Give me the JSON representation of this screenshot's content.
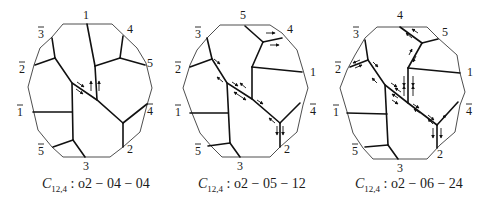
{
  "figure": {
    "panels": [
      {
        "caption": {
          "prefix": "C",
          "subscript": "12,4",
          "rest": " : o2 − 04 − 04",
          "x": 42
        },
        "outline": [
          [
            63,
            24
          ],
          [
            112,
            24
          ],
          [
            137,
            48
          ],
          [
            146,
            63
          ],
          [
            152,
            88
          ],
          [
            147,
            105
          ],
          [
            140,
            132
          ],
          [
            123,
            147
          ],
          [
            110,
            157
          ],
          [
            63,
            157
          ],
          [
            52,
            147
          ],
          [
            38,
            130
          ],
          [
            28,
            87
          ],
          [
            34,
            65
          ],
          [
            40,
            48
          ],
          [
            52,
            37
          ]
        ],
        "edges": [
          [
            [
              52,
              38
            ],
            [
              55,
              58
            ]
          ],
          [
            [
              35,
              65
            ],
            [
              55,
              58
            ]
          ],
          [
            [
              55,
              58
            ],
            [
              72,
              83
            ],
            [
              97,
              100
            ],
            [
              123,
              123
            ]
          ],
          [
            [
              72,
              83
            ],
            [
              73,
              140
            ]
          ],
          [
            [
              33,
              112
            ],
            [
              72,
              112
            ]
          ],
          [
            [
              53,
              147
            ],
            [
              73,
              140
            ]
          ],
          [
            [
              73,
              140
            ],
            [
              85,
              157
            ]
          ],
          [
            [
              87,
              24
            ],
            [
              95,
              66
            ]
          ],
          [
            [
              95,
              66
            ],
            [
              97,
              100
            ]
          ],
          [
            [
              95,
              66
            ],
            [
              120,
              58
            ]
          ],
          [
            [
              120,
              58
            ],
            [
              123,
              36
            ]
          ],
          [
            [
              120,
              58
            ],
            [
              145,
              65
            ]
          ],
          [
            [
              123,
              123
            ],
            [
              147,
              104
            ]
          ],
          [
            [
              123,
              123
            ],
            [
              123,
              147
            ]
          ]
        ],
        "arrows": [
          {
            "x1": 77,
            "y1": 82,
            "x2": 84,
            "y2": 87
          },
          {
            "x1": 76,
            "y1": 89,
            "x2": 83,
            "y2": 94
          },
          {
            "x1": 91,
            "y1": 91,
            "x2": 91,
            "y2": 81
          },
          {
            "x1": 99,
            "y1": 91,
            "x2": 99,
            "y2": 81
          }
        ],
        "labels": [
          {
            "text": "1",
            "bar": false,
            "x": 86,
            "y": 19
          },
          {
            "text": "4",
            "bar": false,
            "x": 130,
            "y": 33
          },
          {
            "text": "5",
            "bar": false,
            "x": 150,
            "y": 67
          },
          {
            "text": "3",
            "bar": true,
            "x": 41,
            "y": 38
          },
          {
            "text": "2",
            "bar": true,
            "x": 22,
            "y": 73
          },
          {
            "text": "1",
            "bar": true,
            "x": 20,
            "y": 116
          },
          {
            "text": "4",
            "bar": true,
            "x": 150,
            "y": 115
          },
          {
            "text": "5",
            "bar": true,
            "x": 41,
            "y": 155
          },
          {
            "text": "2",
            "bar": false,
            "x": 130,
            "y": 153
          },
          {
            "text": "3",
            "bar": false,
            "x": 86,
            "y": 170
          }
        ]
      },
      {
        "caption": {
          "prefix": "C",
          "subscript": "12,4",
          "rest": " : o2 − 05 − 12",
          "x": 198
        },
        "outline": [
          [
            220,
            25
          ],
          [
            270,
            25
          ],
          [
            282,
            33
          ],
          [
            297,
            50
          ],
          [
            303,
            70
          ],
          [
            308,
            88
          ],
          [
            303,
            105
          ],
          [
            297,
            132
          ],
          [
            280,
            147
          ],
          [
            270,
            157
          ],
          [
            222,
            157
          ],
          [
            212,
            147
          ],
          [
            200,
            133
          ],
          [
            192,
            113
          ],
          [
            183,
            88
          ],
          [
            190,
            65
          ],
          [
            197,
            50
          ],
          [
            208,
            37
          ]
        ],
        "edges": [
          [
            [
              207,
              38
            ],
            [
              212,
              59
            ]
          ],
          [
            [
              190,
              67
            ],
            [
              212,
              59
            ]
          ],
          [
            [
              212,
              59
            ],
            [
              227,
              83
            ],
            [
              252,
              99
            ],
            [
              280,
              123
            ]
          ],
          [
            [
              227,
              83
            ],
            [
              230,
              143
            ]
          ],
          [
            [
              190,
              113
            ],
            [
              228,
              113
            ]
          ],
          [
            [
              208,
              146
            ],
            [
              230,
              143
            ]
          ],
          [
            [
              230,
              143
            ],
            [
              240,
              157
            ]
          ],
          [
            [
              245,
              26
            ],
            [
              263,
              42
            ]
          ],
          [
            [
              263,
              42
            ],
            [
              282,
              38
            ]
          ],
          [
            [
              263,
              42
            ],
            [
              252,
              67
            ]
          ],
          [
            [
              252,
              67
            ],
            [
              302,
              72
            ]
          ],
          [
            [
              252,
              67
            ],
            [
              252,
              99
            ]
          ],
          [
            [
              280,
              123
            ],
            [
              300,
              103
            ]
          ],
          [
            [
              280,
              123
            ],
            [
              280,
              147
            ]
          ]
        ],
        "arrows": [
          {
            "x1": 266,
            "y1": 33,
            "x2": 275,
            "y2": 33
          },
          {
            "x1": 270,
            "y1": 45,
            "x2": 279,
            "y2": 45
          },
          {
            "x1": 214,
            "y1": 59,
            "x2": 220,
            "y2": 64
          },
          {
            "x1": 223,
            "y1": 82,
            "x2": 217,
            "y2": 77
          },
          {
            "x1": 232,
            "y1": 82,
            "x2": 238,
            "y2": 86
          },
          {
            "x1": 246,
            "y1": 88,
            "x2": 240,
            "y2": 83
          },
          {
            "x1": 240,
            "y1": 96,
            "x2": 234,
            "y2": 92
          },
          {
            "x1": 240,
            "y1": 96,
            "x2": 246,
            "y2": 100
          },
          {
            "x1": 257,
            "y1": 100,
            "x2": 263,
            "y2": 104
          },
          {
            "x1": 275,
            "y1": 123,
            "x2": 269,
            "y2": 118
          },
          {
            "x1": 277,
            "y1": 126,
            "x2": 277,
            "y2": 135
          },
          {
            "x1": 283,
            "y1": 126,
            "x2": 283,
            "y2": 135
          }
        ],
        "labels": [
          {
            "text": "5",
            "bar": false,
            "x": 243,
            "y": 19
          },
          {
            "text": "4",
            "bar": false,
            "x": 290,
            "y": 33
          },
          {
            "text": "1",
            "bar": false,
            "x": 313,
            "y": 76
          },
          {
            "text": "3",
            "bar": true,
            "x": 198,
            "y": 38
          },
          {
            "text": "2",
            "bar": true,
            "x": 178,
            "y": 73
          },
          {
            "text": "1",
            "bar": true,
            "x": 178,
            "y": 116
          },
          {
            "text": "4",
            "bar": true,
            "x": 313,
            "y": 115
          },
          {
            "text": "5",
            "bar": true,
            "x": 198,
            "y": 155
          },
          {
            "text": "2",
            "bar": false,
            "x": 287,
            "y": 153
          },
          {
            "text": "3",
            "bar": false,
            "x": 240,
            "y": 170
          }
        ]
      },
      {
        "caption": {
          "prefix": "C",
          "subscript": "12,4",
          "rest": " : o2 − 06 − 24",
          "x": 355
        },
        "outline": [
          [
            377,
            27
          ],
          [
            427,
            27
          ],
          [
            438,
            38
          ],
          [
            457,
            55
          ],
          [
            460,
            73
          ],
          [
            465,
            92
          ],
          [
            460,
            105
          ],
          [
            455,
            132
          ],
          [
            440,
            145
          ],
          [
            427,
            159
          ],
          [
            373,
            159
          ],
          [
            363,
            148
          ],
          [
            353,
            133
          ],
          [
            348,
            115
          ],
          [
            340,
            88
          ],
          [
            347,
            70
          ],
          [
            355,
            55
          ],
          [
            365,
            38
          ]
        ],
        "edges": [
          [
            [
              365,
              40
            ],
            [
              368,
              60
            ]
          ],
          [
            [
              350,
              67
            ],
            [
              368,
              60
            ]
          ],
          [
            [
              368,
              60
            ],
            [
              385,
              85
            ],
            [
              408,
              103
            ],
            [
              437,
              125
            ]
          ],
          [
            [
              385,
              85
            ],
            [
              388,
              145
            ]
          ],
          [
            [
              347,
              113
            ],
            [
              387,
              114
            ]
          ],
          [
            [
              365,
              147
            ],
            [
              388,
              145
            ]
          ],
          [
            [
              388,
              145
            ],
            [
              398,
              159
            ]
          ],
          [
            [
              400,
              27
            ],
            [
              422,
              43
            ]
          ],
          [
            [
              422,
              43
            ],
            [
              438,
              39
            ]
          ],
          [
            [
              422,
              43
            ],
            [
              408,
              68
            ]
          ],
          [
            [
              408,
              68
            ],
            [
              460,
              73
            ]
          ],
          [
            [
              408,
              68
            ],
            [
              408,
              103
            ]
          ],
          [
            [
              437,
              125
            ],
            [
              458,
              102
            ]
          ],
          [
            [
              437,
              125
            ],
            [
              437,
              148
            ]
          ]
        ],
        "arrows": [
          {
            "x1": 412,
            "y1": 38,
            "x2": 406,
            "y2": 33
          },
          {
            "x1": 418,
            "y1": 33,
            "x2": 412,
            "y2": 29
          },
          {
            "x1": 360,
            "y1": 60,
            "x2": 353,
            "y2": 63
          },
          {
            "x1": 355,
            "y1": 68,
            "x2": 362,
            "y2": 65
          },
          {
            "x1": 373,
            "y1": 62,
            "x2": 378,
            "y2": 67
          },
          {
            "x1": 409,
            "y1": 55,
            "x2": 412,
            "y2": 49
          },
          {
            "x1": 416,
            "y1": 56,
            "x2": 413,
            "y2": 62
          },
          {
            "x1": 377,
            "y1": 83,
            "x2": 372,
            "y2": 78
          },
          {
            "x1": 404,
            "y1": 76,
            "x2": 404,
            "y2": 86
          },
          {
            "x1": 404,
            "y1": 96,
            "x2": 404,
            "y2": 86
          },
          {
            "x1": 413,
            "y1": 76,
            "x2": 413,
            "y2": 86
          },
          {
            "x1": 413,
            "y1": 96,
            "x2": 413,
            "y2": 86
          },
          {
            "x1": 391,
            "y1": 83,
            "x2": 397,
            "y2": 87
          },
          {
            "x1": 401,
            "y1": 92,
            "x2": 395,
            "y2": 88
          },
          {
            "x1": 398,
            "y1": 98,
            "x2": 392,
            "y2": 94
          },
          {
            "x1": 392,
            "y1": 100,
            "x2": 398,
            "y2": 104
          },
          {
            "x1": 413,
            "y1": 104,
            "x2": 419,
            "y2": 108
          },
          {
            "x1": 420,
            "y1": 113,
            "x2": 414,
            "y2": 109
          },
          {
            "x1": 428,
            "y1": 115,
            "x2": 434,
            "y2": 120
          },
          {
            "x1": 433,
            "y1": 124,
            "x2": 428,
            "y2": 119
          },
          {
            "x1": 442,
            "y1": 119,
            "x2": 446,
            "y2": 115
          },
          {
            "x1": 433,
            "y1": 128,
            "x2": 433,
            "y2": 138
          },
          {
            "x1": 441,
            "y1": 128,
            "x2": 441,
            "y2": 138
          }
        ],
        "labels": [
          {
            "text": "4",
            "bar": false,
            "x": 400,
            "y": 19
          },
          {
            "text": "5",
            "bar": false,
            "x": 445,
            "y": 36
          },
          {
            "text": "1",
            "bar": false,
            "x": 470,
            "y": 76
          },
          {
            "text": "3",
            "bar": true,
            "x": 356,
            "y": 38
          },
          {
            "text": "2",
            "bar": true,
            "x": 338,
            "y": 73
          },
          {
            "text": "1",
            "bar": true,
            "x": 336,
            "y": 116
          },
          {
            "text": "4",
            "bar": true,
            "x": 469,
            "y": 115
          },
          {
            "text": "5",
            "bar": true,
            "x": 355,
            "y": 155
          },
          {
            "text": "2",
            "bar": false,
            "x": 440,
            "y": 158
          },
          {
            "text": "3",
            "bar": false,
            "x": 400,
            "y": 172
          }
        ]
      }
    ]
  }
}
